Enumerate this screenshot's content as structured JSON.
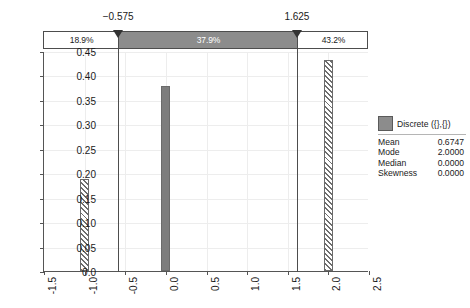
{
  "chart_data": {
    "type": "bar",
    "title": "",
    "xlabel": "",
    "ylabel": "",
    "x": [
      -1.0,
      0.0,
      2.0
    ],
    "values": [
      0.189,
      0.379,
      0.432
    ],
    "categories": [
      "-1.0",
      "0.0",
      "2.0"
    ],
    "xlim": [
      -1.5,
      2.5
    ],
    "ylim": [
      0.0,
      0.45
    ],
    "grid": true,
    "legend_position": "right",
    "series": [
      {
        "name": "Discrete ({},{})",
        "values": [
          0.189,
          0.379,
          0.432
        ]
      }
    ],
    "xticks": [
      "-1.5",
      "-1.0",
      "-0.5",
      "0.0",
      "0.5",
      "1.0",
      "1.5",
      "2.0",
      "2.5"
    ],
    "xtick_values": [
      -1.5,
      -1.0,
      -0.5,
      0.0,
      0.5,
      1.0,
      1.5,
      2.0,
      2.5
    ],
    "yticks": [
      "0.0",
      "0.05",
      "0.10",
      "0.15",
      "0.20",
      "0.25",
      "0.30",
      "0.35",
      "0.40",
      "0.45"
    ],
    "ytick_values": [
      0.0,
      0.05,
      0.1,
      0.15,
      0.2,
      0.25,
      0.3,
      0.35,
      0.4,
      0.45
    ],
    "annotations": [
      {
        "label": "18.9%",
        "region": "left-tail"
      },
      {
        "label": "37.9%",
        "region": "center-selected"
      },
      {
        "label": "43.2%",
        "region": "right-tail"
      }
    ]
  },
  "band": {
    "lower_handle_label": "−0.575",
    "upper_handle_label": "1.625",
    "lower_handle_value": -0.575,
    "upper_handle_value": 1.625,
    "left_percent": "18.9%",
    "center_percent": "37.9%",
    "right_percent": "43.2%"
  },
  "legend": {
    "title": "Discrete ({},{})",
    "stats": [
      {
        "name": "Mean",
        "value": "0.6747"
      },
      {
        "name": "Mode",
        "value": "2.0000"
      },
      {
        "name": "Median",
        "value": "0.0000"
      },
      {
        "name": "Skewness",
        "value": "0.0000"
      }
    ]
  },
  "colors": {
    "bar_fill": "#7d7d7d",
    "band_fill": "#8c8c8c",
    "axis": "#555555",
    "grid": "#ededed"
  }
}
